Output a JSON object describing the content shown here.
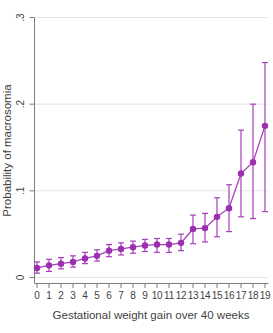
{
  "chart_data": {
    "type": "line",
    "title": "",
    "xlabel": "Gestational weight gain over 40 weeks",
    "ylabel": "Probability of macrosomia",
    "x": [
      0,
      1,
      2,
      3,
      4,
      5,
      6,
      7,
      8,
      9,
      10,
      11,
      12,
      13,
      14,
      15,
      16,
      17,
      18,
      19
    ],
    "x_tick_labels": [
      "0",
      "1",
      "2",
      "3",
      "4",
      "5",
      "6",
      "7",
      "8",
      "9",
      "10",
      "11",
      "12",
      "13",
      "14",
      "15",
      "16",
      "17",
      "18",
      "19"
    ],
    "yticks": [
      0,
      0.1,
      0.2,
      0.3
    ],
    "ytick_labels": [
      "0",
      ".1",
      ".2",
      ".3"
    ],
    "ylim": [
      0,
      0.3
    ],
    "grid": true,
    "legend": "none",
    "series": [
      {
        "name": "predicted-probability-of-macrosomia",
        "values": [
          0.011,
          0.014,
          0.016,
          0.018,
          0.022,
          0.025,
          0.031,
          0.033,
          0.035,
          0.037,
          0.038,
          0.038,
          0.04,
          0.056,
          0.057,
          0.07,
          0.08,
          0.12,
          0.133,
          0.175
        ],
        "ci_low": [
          0.005,
          0.007,
          0.01,
          0.012,
          0.016,
          0.019,
          0.024,
          0.026,
          0.028,
          0.03,
          0.029,
          0.029,
          0.031,
          0.039,
          0.041,
          0.047,
          0.053,
          0.07,
          0.068,
          0.076
        ],
        "ci_high": [
          0.018,
          0.021,
          0.023,
          0.025,
          0.029,
          0.032,
          0.038,
          0.04,
          0.042,
          0.044,
          0.045,
          0.045,
          0.05,
          0.072,
          0.074,
          0.092,
          0.107,
          0.17,
          0.2,
          0.248
        ]
      }
    ],
    "colors": {
      "marker": "#9b2fb0",
      "line": "#a63fbc",
      "error_bar": "#a63fbc",
      "grid": "#e5e5e5",
      "axis": "#7d7d7d",
      "text": "#3f3f3f"
    }
  }
}
